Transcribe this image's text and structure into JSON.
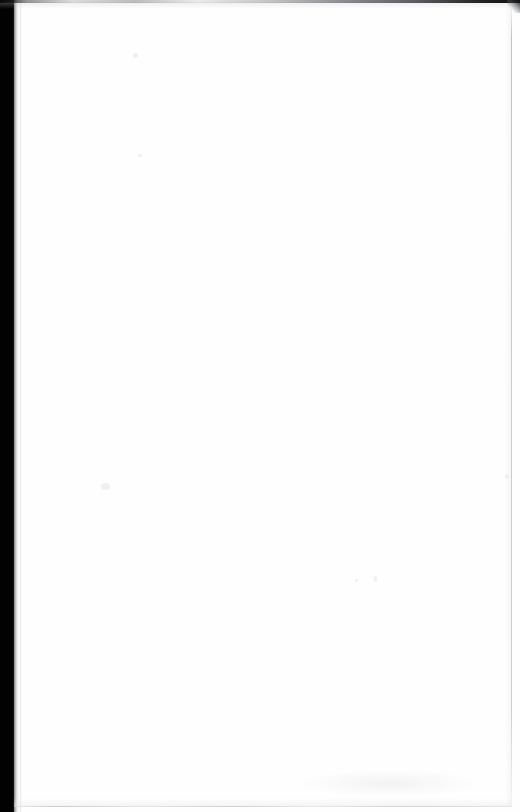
{
  "document": {
    "kind": "scanned-page",
    "page_content": "",
    "content_note": "blank page",
    "width": 520,
    "height": 812
  },
  "artifacts": {
    "gutter": {
      "name": "left-binding-gutter-shadow",
      "color": "#020202",
      "edge": "left"
    },
    "top_edge": {
      "name": "top-scan-edge",
      "color": "#0a0a0a",
      "edge": "top"
    },
    "right_edge": {
      "name": "right-page-boundary",
      "color": "#9a9b9f",
      "edge": "right"
    },
    "bottom_edge": {
      "name": "bottom-page-boundary",
      "color": "#a8a9ad",
      "edge": "bottom"
    },
    "corner": {
      "name": "top-right-corner-notch",
      "color": "#0e0e10"
    }
  },
  "colors": {
    "paper": "#fefefe",
    "gutter_black": "#020202",
    "edge_gray": "#9a9b9f",
    "speck_gray": "#ecedf0"
  }
}
